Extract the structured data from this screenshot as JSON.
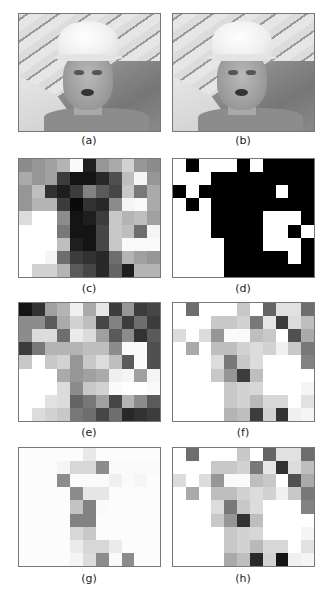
{
  "figure": {
    "panels": [
      {
        "id": "a",
        "label": "(a)",
        "type": "photo"
      },
      {
        "id": "b",
        "label": "(b)",
        "type": "photo"
      },
      {
        "id": "c",
        "label": "(c)",
        "type": "grid"
      },
      {
        "id": "d",
        "label": "(d)",
        "type": "grid"
      },
      {
        "id": "e",
        "label": "(e)",
        "type": "grid"
      },
      {
        "id": "f",
        "label": "(f)",
        "type": "grid"
      },
      {
        "id": "g",
        "label": "(g)",
        "type": "grid"
      },
      {
        "id": "h",
        "label": "(h)",
        "type": "grid"
      }
    ],
    "grid_size": {
      "cols": 11,
      "rows": 9
    },
    "grids": {
      "c": [
        [
          140,
          150,
          160,
          180,
          250,
          30,
          150,
          170,
          210,
          150,
          140
        ],
        [
          170,
          150,
          160,
          60,
          20,
          20,
          40,
          80,
          190,
          245,
          150
        ],
        [
          150,
          190,
          50,
          30,
          60,
          130,
          90,
          70,
          200,
          120,
          170
        ],
        [
          150,
          180,
          180,
          60,
          10,
          50,
          40,
          140,
          245,
          250,
          170
        ],
        [
          220,
          255,
          255,
          140,
          20,
          30,
          60,
          200,
          180,
          190,
          160
        ],
        [
          255,
          255,
          255,
          120,
          20,
          20,
          70,
          200,
          190,
          110,
          245
        ],
        [
          255,
          255,
          255,
          190,
          30,
          20,
          70,
          200,
          250,
          250,
          250
        ],
        [
          255,
          255,
          245,
          110,
          60,
          50,
          40,
          110,
          180,
          160,
          150
        ],
        [
          255,
          210,
          210,
          180,
          90,
          70,
          40,
          100,
          30,
          180,
          180
        ]
      ],
      "d": [
        [
          255,
          0,
          255,
          255,
          255,
          0,
          255,
          0,
          0,
          0,
          0
        ],
        [
          255,
          255,
          255,
          0,
          0,
          0,
          0,
          0,
          0,
          0,
          0
        ],
        [
          0,
          255,
          0,
          0,
          0,
          0,
          0,
          0,
          255,
          0,
          0
        ],
        [
          255,
          0,
          255,
          0,
          0,
          0,
          0,
          0,
          0,
          0,
          0
        ],
        [
          255,
          255,
          255,
          0,
          0,
          0,
          0,
          255,
          255,
          255,
          0
        ],
        [
          255,
          255,
          255,
          0,
          0,
          0,
          0,
          255,
          255,
          0,
          255
        ],
        [
          255,
          255,
          255,
          255,
          0,
          0,
          0,
          255,
          255,
          255,
          0
        ],
        [
          255,
          255,
          255,
          255,
          0,
          0,
          0,
          0,
          0,
          255,
          0
        ],
        [
          255,
          255,
          255,
          255,
          0,
          0,
          0,
          0,
          0,
          0,
          0
        ]
      ],
      "e": [
        [
          20,
          50,
          160,
          180,
          240,
          170,
          230,
          60,
          150,
          60,
          70
        ],
        [
          140,
          140,
          90,
          170,
          210,
          190,
          70,
          130,
          60,
          110,
          60
        ],
        [
          140,
          220,
          220,
          110,
          235,
          220,
          160,
          90,
          140,
          50,
          90
        ],
        [
          60,
          120,
          180,
          180,
          180,
          190,
          190,
          140,
          250,
          250,
          80
        ],
        [
          200,
          255,
          200,
          210,
          150,
          200,
          220,
          190,
          90,
          250,
          80
        ],
        [
          255,
          255,
          255,
          170,
          150,
          160,
          170,
          240,
          245,
          160,
          245
        ],
        [
          255,
          255,
          255,
          220,
          140,
          200,
          210,
          250,
          255,
          255,
          250
        ],
        [
          255,
          255,
          225,
          220,
          100,
          120,
          160,
          70,
          180,
          140,
          90
        ],
        [
          255,
          220,
          210,
          200,
          120,
          110,
          70,
          110,
          40,
          50,
          60
        ]
      ],
      "f": [
        [
          255,
          110,
          255,
          255,
          255,
          200,
          255,
          100,
          225,
          225,
          110
        ],
        [
          255,
          255,
          255,
          200,
          200,
          210,
          120,
          230,
          60,
          220,
          190
        ],
        [
          220,
          255,
          220,
          150,
          250,
          250,
          190,
          200,
          255,
          80,
          170
        ],
        [
          255,
          170,
          255,
          190,
          190,
          210,
          220,
          210,
          240,
          200,
          120
        ],
        [
          255,
          255,
          255,
          220,
          120,
          200,
          220,
          255,
          255,
          255,
          130
        ],
        [
          255,
          255,
          255,
          200,
          150,
          60,
          190,
          255,
          255,
          255,
          255
        ],
        [
          255,
          255,
          255,
          255,
          200,
          210,
          215,
          255,
          255,
          255,
          245
        ],
        [
          255,
          255,
          255,
          255,
          200,
          210,
          185,
          215,
          215,
          255,
          225
        ],
        [
          255,
          255,
          255,
          255,
          180,
          190,
          60,
          210,
          50,
          240,
          245
        ]
      ],
      "g": [
        [
          252,
          252,
          252,
          252,
          252,
          232,
          252,
          252,
          252,
          252,
          252
        ],
        [
          252,
          252,
          252,
          245,
          215,
          215,
          140,
          250,
          250,
          250,
          250
        ],
        [
          252,
          252,
          252,
          140,
          250,
          250,
          250,
          240,
          250,
          245,
          252
        ],
        [
          252,
          252,
          252,
          252,
          140,
          230,
          230,
          252,
          252,
          252,
          252
        ],
        [
          252,
          252,
          252,
          252,
          195,
          130,
          250,
          252,
          252,
          252,
          252
        ],
        [
          252,
          252,
          252,
          252,
          130,
          130,
          252,
          252,
          252,
          252,
          252
        ],
        [
          252,
          252,
          252,
          252,
          215,
          200,
          252,
          252,
          252,
          252,
          252
        ],
        [
          252,
          252,
          252,
          252,
          235,
          215,
          215,
          235,
          252,
          252,
          252
        ],
        [
          252,
          252,
          252,
          252,
          245,
          220,
          140,
          250,
          140,
          252,
          252
        ]
      ],
      "h": [
        [
          255,
          110,
          255,
          255,
          255,
          200,
          255,
          100,
          225,
          225,
          110
        ],
        [
          255,
          255,
          255,
          200,
          200,
          210,
          120,
          230,
          50,
          220,
          190
        ],
        [
          220,
          255,
          220,
          150,
          250,
          250,
          190,
          200,
          255,
          80,
          170
        ],
        [
          255,
          170,
          255,
          190,
          190,
          210,
          220,
          210,
          240,
          200,
          120
        ],
        [
          255,
          255,
          255,
          220,
          120,
          200,
          220,
          255,
          255,
          255,
          130
        ],
        [
          255,
          255,
          255,
          200,
          150,
          50,
          190,
          255,
          255,
          255,
          255
        ],
        [
          255,
          255,
          255,
          255,
          200,
          210,
          215,
          255,
          255,
          255,
          245
        ],
        [
          255,
          255,
          255,
          255,
          200,
          210,
          185,
          215,
          215,
          255,
          225
        ],
        [
          255,
          255,
          255,
          255,
          170,
          190,
          40,
          210,
          20,
          240,
          245
        ]
      ]
    }
  }
}
